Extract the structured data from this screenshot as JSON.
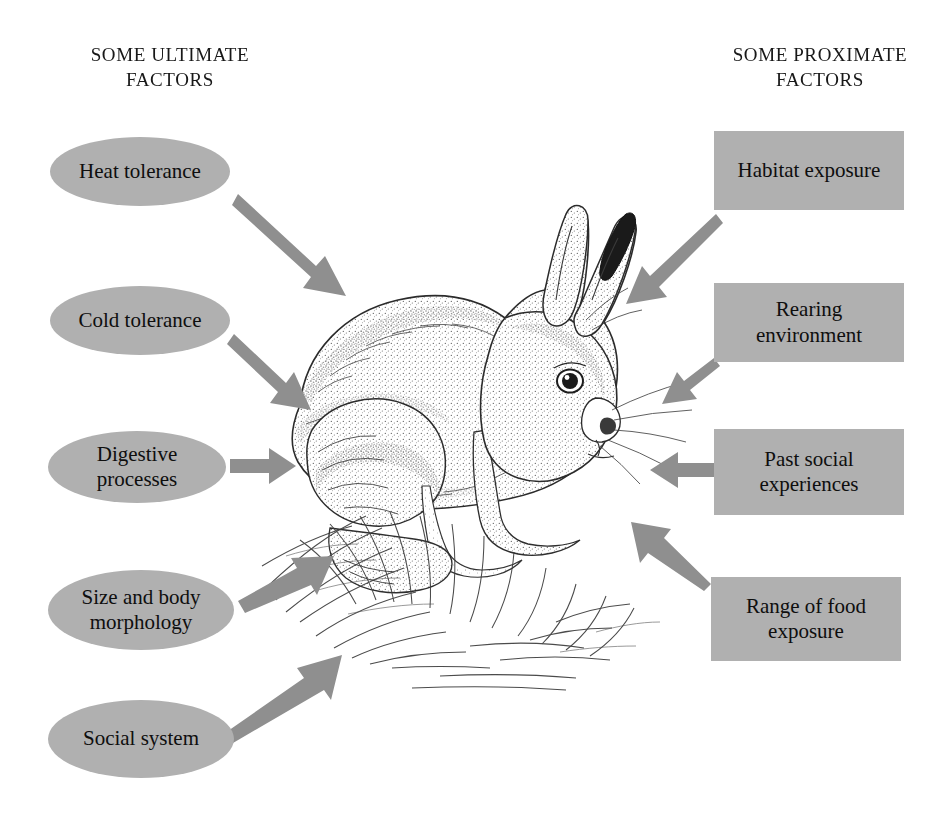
{
  "page": {
    "background_color": "#ffffff",
    "figure_kind": "concept-diagram",
    "subject_illustration": "rabbit-illustration"
  },
  "headings": {
    "left": "SOME ULTIMATE\nFACTORS",
    "right": "SOME PROXIMATE\nFACTORS"
  },
  "style": {
    "node_fill": "#b0b0b0",
    "arrow_color": "#8c8c8c",
    "text_color": "#111111"
  },
  "ultimate_factors": [
    {
      "label": "Heat tolerance",
      "shape": "ellipse"
    },
    {
      "label": "Cold tolerance",
      "shape": "ellipse"
    },
    {
      "label": "Digestive\nprocesses",
      "shape": "ellipse"
    },
    {
      "label": "Size and body\nmorphology",
      "shape": "ellipse"
    },
    {
      "label": "Social system",
      "shape": "ellipse"
    }
  ],
  "proximate_factors": [
    {
      "label": "Habitat exposure",
      "shape": "rectangle"
    },
    {
      "label": "Rearing\nenvironment",
      "shape": "rectangle"
    },
    {
      "label": "Past social\nexperiences",
      "shape": "rectangle"
    },
    {
      "label": "Range of food\nexposure",
      "shape": "rectangle"
    }
  ],
  "arrows": [
    {
      "from": "Heat tolerance",
      "to": "rabbit",
      "direction": "down-right"
    },
    {
      "from": "Cold tolerance",
      "to": "rabbit",
      "direction": "down-right"
    },
    {
      "from": "Digestive processes",
      "to": "rabbit",
      "direction": "right"
    },
    {
      "from": "Size and body morphology",
      "to": "rabbit",
      "direction": "up-right"
    },
    {
      "from": "Social system",
      "to": "rabbit",
      "direction": "up-right"
    },
    {
      "from": "Habitat exposure",
      "to": "rabbit",
      "direction": "down-left"
    },
    {
      "from": "Rearing environment",
      "to": "rabbit",
      "direction": "down-left"
    },
    {
      "from": "Past social experiences",
      "to": "rabbit",
      "direction": "left"
    },
    {
      "from": "Range of food exposure",
      "to": "rabbit",
      "direction": "up-left"
    }
  ],
  "illustration": {
    "name": "rabbit-illustration",
    "description": "pen-and-ink stipple drawing of a rabbit sitting in grass"
  }
}
